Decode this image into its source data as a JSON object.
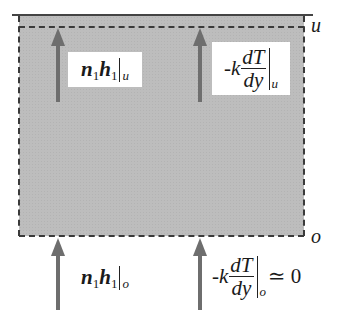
{
  "diagram": {
    "type": "control-volume energy balance",
    "boundaries": {
      "upper_label": "u",
      "lower_label": "o"
    },
    "fluxes": {
      "top_convective": {
        "n": "n",
        "n_sub": "1",
        "h": "h",
        "h_sub": "1",
        "eval": "u"
      },
      "top_conductive": {
        "prefix": "-k",
        "num": "dT",
        "den": "dy",
        "eval": "u"
      },
      "bottom_convective": {
        "n": "n",
        "n_sub": "1",
        "h": "h",
        "h_sub": "1",
        "eval": "o"
      },
      "bottom_conductive": {
        "prefix": "-k",
        "num": "dT",
        "den": "dy",
        "eval": "o",
        "approx": "≃ 0"
      }
    },
    "colors": {
      "volume_fill": "#bdbdbd",
      "arrow": "#6e6e6e",
      "boundary_line": "#3a3a3a",
      "label_background": "#ffffff"
    }
  }
}
